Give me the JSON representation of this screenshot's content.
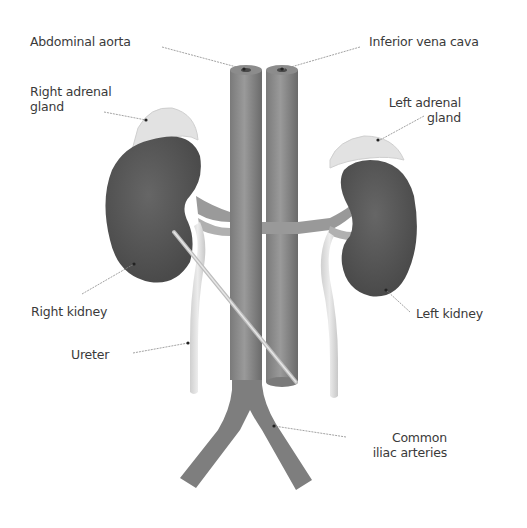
{
  "diagram": {
    "labels": {
      "abdominal_aorta": "Abdominal aorta",
      "inferior_vena_cava": "Inferior vena cava",
      "right_adrenal_gland": "Right adrenal\ngland",
      "left_adrenal_gland": "Left adrenal\ngland",
      "right_kidney": "Right kidney",
      "left_kidney": "Left kidney",
      "ureter": "Ureter",
      "common_iliac_arteries": "Common\niliac arteries"
    },
    "colors": {
      "kidney": "#5c5c5c",
      "vessel": "#8a8a8a",
      "vessel_shade": "#6e6e6e",
      "adrenal": "#e2e2e2",
      "ureter": "#dcdcdc",
      "leader_line": "#8a8a8a",
      "text": "#3a3a3a"
    }
  }
}
